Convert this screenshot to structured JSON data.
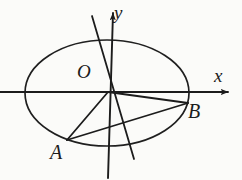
{
  "figure": {
    "kind": "analytic-geometry-diagram",
    "background_color": "#fbfbf9",
    "stroke_color": "#1c1c1c",
    "canvas": {
      "width": 242,
      "height": 180
    }
  },
  "axes": {
    "x_label": "x",
    "y_label": "y",
    "origin_label": "O",
    "origin": {
      "x": 108,
      "y": 92
    },
    "x_axis": {
      "x1": 0,
      "y1": 92,
      "x2": 232,
      "y2": 92,
      "arrow": "right"
    },
    "y_axis": {
      "x1": 108,
      "y1": 178,
      "x2": 108,
      "y2": 8,
      "arrow": "up"
    }
  },
  "ellipse": {
    "center": {
      "x": 107,
      "y": 93
    },
    "semi_major_x": 82,
    "semi_minor_y": 53,
    "stroke_width": 1.7
  },
  "points": [
    {
      "name": "O",
      "label": "O",
      "x": 108,
      "y": 92
    },
    {
      "name": "A",
      "label": "A",
      "x": 67,
      "y": 140
    },
    {
      "name": "B",
      "label": "B",
      "x": 188,
      "y": 103
    }
  ],
  "segments": [
    {
      "name": "segment-OA",
      "from": "O",
      "to": "A",
      "x1": 108,
      "y1": 92,
      "x2": 67,
      "y2": 140
    },
    {
      "name": "segment-OB",
      "from": "O",
      "to": "B",
      "x1": 108,
      "y1": 92,
      "x2": 188,
      "y2": 103
    },
    {
      "name": "segment-AB",
      "from": "A",
      "to": "B",
      "x1": 67,
      "y1": 140,
      "x2": 188,
      "y2": 103
    }
  ],
  "slant_line": {
    "name": "slant-line-through-origin",
    "x1": 92,
    "y1": 16,
    "x2": 134,
    "y2": 159
  }
}
